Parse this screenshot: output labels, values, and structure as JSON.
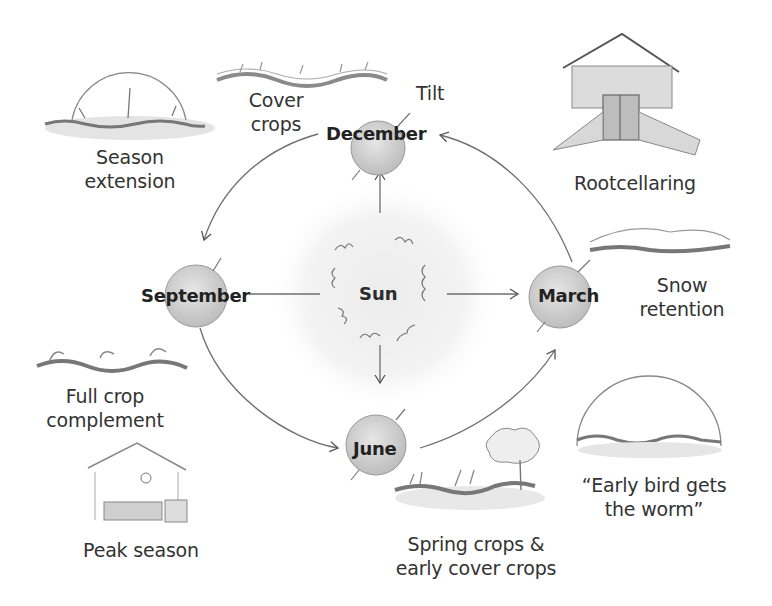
{
  "diagram": {
    "center": {
      "label": "Sun"
    },
    "seasons": [
      {
        "id": "december",
        "label": "December",
        "annotation": "Tilt"
      },
      {
        "id": "march",
        "label": "March"
      },
      {
        "id": "june",
        "label": "June"
      },
      {
        "id": "september",
        "label": "September"
      }
    ],
    "activities": [
      {
        "id": "cover-crops",
        "lines": [
          "Cover",
          "crops"
        ],
        "near": "December"
      },
      {
        "id": "season-extension",
        "lines": [
          "Season",
          "extension"
        ],
        "near": "December/September"
      },
      {
        "id": "rootcellaring",
        "lines": [
          "Rootcellaring"
        ],
        "near": "December/March"
      },
      {
        "id": "snow-retention",
        "lines": [
          "Snow",
          "retention"
        ],
        "near": "March"
      },
      {
        "id": "early-bird",
        "lines": [
          "“Early bird gets",
          "the worm”"
        ],
        "near": "March/June"
      },
      {
        "id": "spring-crops",
        "lines": [
          "Spring crops &",
          "early cover crops"
        ],
        "near": "June"
      },
      {
        "id": "full-crop",
        "lines": [
          "Full crop",
          "complement"
        ],
        "near": "September"
      },
      {
        "id": "peak-season",
        "lines": [
          "Peak season"
        ],
        "near": "June/September"
      }
    ],
    "orbit_direction": [
      "March",
      "December",
      "September",
      "June",
      "March"
    ],
    "colors": {
      "ink": "#2b2b2b",
      "pencil": "#8a8a8a",
      "shade": "#d6d6d6",
      "background": "#ffffff"
    }
  }
}
